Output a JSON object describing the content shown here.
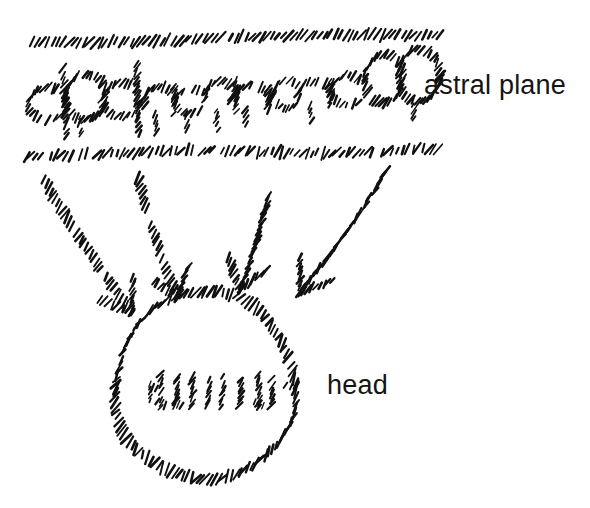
{
  "figure": {
    "background_color": "#ffffff",
    "ink_color": "#111111",
    "style": "hand-drawn hatched dash strokes"
  },
  "labels": {
    "astral_plane": "astral plane",
    "head": "head"
  },
  "annotations": {
    "astral_plane_band": {
      "name": "astral-plane-band",
      "description": "horizontal band bounded by two dashed hatch rules containing illegible scribbled cursive writing",
      "top_rule_y": 38,
      "bottom_rule_y": 152,
      "left": 32,
      "right": 440
    },
    "scribble_text_band": {
      "name": "illegible-scribble-text",
      "description": "unreadable handwritten cursive rendered in hatch dashes",
      "baseline_y": 118
    },
    "head_circle": {
      "name": "head-circle",
      "center_x": 205,
      "center_y": 386,
      "radius_x": 90,
      "radius_y": 94
    },
    "head_inner_scribble": {
      "name": "head-inner-scribble",
      "description": "row of short illegible hatched strokes inside the head circle",
      "baseline_y": 398,
      "left": 142,
      "right": 280
    },
    "arrows": [
      {
        "name": "arrow-1",
        "from_x": 44,
        "from_y": 180,
        "to_x": 132,
        "to_y": 312,
        "direction": "down-right"
      },
      {
        "name": "arrow-2",
        "from_x": 138,
        "from_y": 178,
        "to_x": 178,
        "to_y": 298,
        "direction": "down-right"
      },
      {
        "name": "arrow-3",
        "from_x": 268,
        "from_y": 196,
        "to_x": 240,
        "to_y": 290,
        "direction": "down-left"
      },
      {
        "name": "arrow-4",
        "from_x": 386,
        "from_y": 172,
        "to_x": 300,
        "to_y": 292,
        "direction": "down-left"
      }
    ]
  }
}
